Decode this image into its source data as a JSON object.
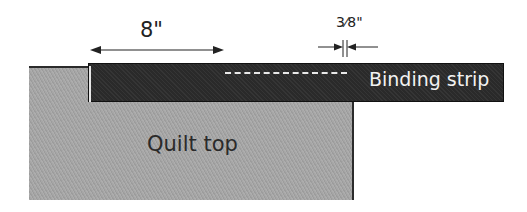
{
  "diagram": {
    "labels": {
      "quilt_top": "Quilt top",
      "binding_strip": "Binding strip",
      "length_dimension": "8\"",
      "seam_allowance_dimension": "3⁄8\""
    },
    "colors": {
      "quilt_top": "#a6a6a6",
      "binding_strip": "#2a2a2a",
      "stitch_line": "#e8e8e8",
      "text_dark": "#222222",
      "text_light": "#f2f2f2"
    },
    "elements": [
      {
        "name": "quilt-top",
        "type": "rectangle"
      },
      {
        "name": "binding-strip",
        "type": "rectangle"
      },
      {
        "name": "stitch-line",
        "type": "dashed-line"
      },
      {
        "name": "length-arrow",
        "type": "double-arrow"
      },
      {
        "name": "seam-allowance-marker",
        "type": "inward-arrows"
      }
    ]
  }
}
